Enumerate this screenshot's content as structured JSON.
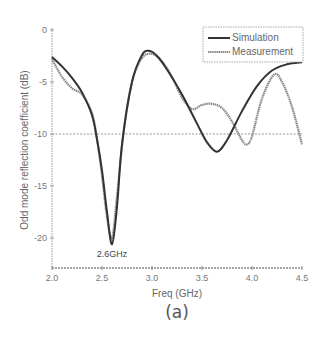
{
  "chart_data": {
    "type": "line",
    "title": "",
    "xlabel": "Freq (GHz)",
    "ylabel": "Odd mode reflection coefficient (dB)",
    "caption": "(a)",
    "xlim": [
      2.0,
      4.5
    ],
    "ylim": [
      -22.9,
      0
    ],
    "x_ticks": [
      "2.0",
      "2.5",
      "3.0",
      "3.5",
      "4.0",
      "4.5"
    ],
    "y_ticks": [
      "0",
      "-5",
      "-10",
      "-15",
      "-20"
    ],
    "grid": false,
    "reference_line": {
      "y": -10,
      "style": "dotted"
    },
    "legend": {
      "position": "upper right",
      "entries": [
        "Simulation",
        "Measurement"
      ]
    },
    "annotations": [
      {
        "text": "2.6GHz",
        "x": 2.6,
        "y": -20.6
      }
    ],
    "series": [
      {
        "name": "Simulation",
        "color": "#333333",
        "x": [
          2.0,
          2.1,
          2.2,
          2.3,
          2.4,
          2.45,
          2.5,
          2.55,
          2.6,
          2.65,
          2.7,
          2.8,
          2.9,
          2.97,
          3.05,
          3.15,
          3.3,
          3.45,
          3.55,
          3.65,
          3.75,
          3.9,
          4.05,
          4.2,
          4.35,
          4.5
        ],
        "y": [
          -2.6,
          -3.5,
          -4.6,
          -6.0,
          -8.2,
          -10.5,
          -13.5,
          -17.5,
          -20.6,
          -17.0,
          -11.0,
          -5.0,
          -2.4,
          -2.0,
          -2.5,
          -3.8,
          -6.2,
          -9.0,
          -10.8,
          -11.7,
          -10.6,
          -7.8,
          -5.4,
          -3.9,
          -3.3,
          -3.1
        ]
      },
      {
        "name": "Measurement",
        "color": "#888888",
        "x": [
          2.0,
          2.1,
          2.2,
          2.3,
          2.4,
          2.45,
          2.5,
          2.55,
          2.6,
          2.65,
          2.72,
          2.8,
          2.9,
          3.0,
          3.1,
          3.2,
          3.3,
          3.4,
          3.5,
          3.6,
          3.7,
          3.8,
          3.9,
          3.95,
          4.0,
          4.1,
          4.22,
          4.3,
          4.4,
          4.5
        ],
        "y": [
          -2.8,
          -4.5,
          -5.6,
          -6.2,
          -8.0,
          -10.5,
          -14.0,
          -18.0,
          -20.0,
          -16.0,
          -9.5,
          -5.0,
          -2.7,
          -2.3,
          -3.0,
          -4.5,
          -6.5,
          -7.6,
          -7.2,
          -7.1,
          -7.5,
          -8.8,
          -10.6,
          -11.0,
          -10.2,
          -6.6,
          -4.3,
          -5.0,
          -7.4,
          -11.0
        ]
      }
    ]
  }
}
